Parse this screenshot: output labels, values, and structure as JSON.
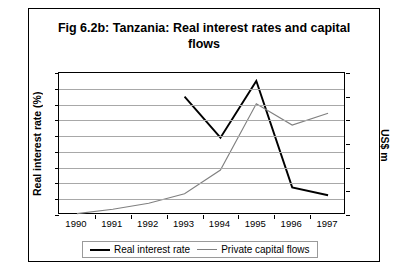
{
  "title": "Fig 6.2b: Tanzania: Real interest rates and capital flows",
  "axis": {
    "left_label": "Real interest rate (%)",
    "right_label": "US$ m"
  },
  "legend": {
    "items": [
      {
        "label": "Real interest rate",
        "color": "#000000"
      },
      {
        "label": "Private capital flows",
        "color": "#808080"
      }
    ]
  },
  "chart_data": {
    "type": "line",
    "title": "Fig 6.2b: Tanzania: Real interest rates and capital flows",
    "xlabel": "",
    "ylabel": "Real interest rate (%)",
    "y2label": "US$ m",
    "categories": [
      "1990",
      "1991",
      "1992",
      "1993",
      "1994",
      "1995",
      "1996",
      "1997"
    ],
    "x": [
      1990,
      1991,
      1992,
      1993,
      1994,
      1995,
      1996,
      1997
    ],
    "ylim": [
      -8,
      10
    ],
    "yticks": [
      10,
      8,
      6,
      4,
      2,
      0,
      -2,
      -4,
      -6,
      -8
    ],
    "y2lim": [
      0,
      300
    ],
    "y2ticks": [
      300,
      250,
      200,
      150,
      100,
      50,
      0
    ],
    "grid": true,
    "legend_position": "bottom",
    "series": [
      {
        "name": "Real interest rate",
        "axis": "left",
        "units": "%",
        "color": "#000000",
        "values": [
          null,
          null,
          null,
          7.0,
          1.8,
          9.0,
          -4.5,
          -5.5
        ]
      },
      {
        "name": "Private capital flows",
        "axis": "right",
        "units": "US$ m",
        "color": "#808080",
        "values": [
          3,
          12,
          25,
          45,
          95,
          235,
          190,
          215
        ]
      }
    ]
  }
}
